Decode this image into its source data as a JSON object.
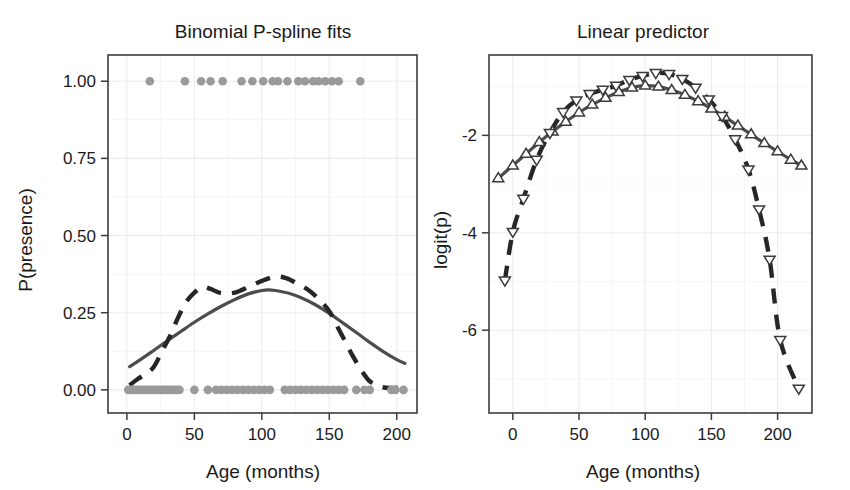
{
  "figure": {
    "width": 850,
    "height": 490,
    "background": "#ffffff",
    "panel_count": 2,
    "colors": {
      "solid_fit": "#4d4d4d",
      "dashed_fit": "#262626",
      "observed_points": "#9a9a9a",
      "marker_stroke": "#3a3a3a",
      "marker_fill": "#ffffff",
      "axis": "#3c3c3c",
      "gridline_major": "#ececec",
      "gridline_minor": "#f5f5f5",
      "text": "#1a1a1a"
    }
  },
  "chart_data": [
    {
      "type": "line",
      "panel": "left",
      "title": "Binomial P-spline fits",
      "xlabel": "Age (months)",
      "ylabel": "P(presence)",
      "xlim": [
        -14,
        215
      ],
      "ylim": [
        -0.075,
        1.085
      ],
      "xticks": [
        0,
        50,
        100,
        150,
        200
      ],
      "xtick_labels": [
        "0",
        "50",
        "100",
        "150",
        "200"
      ],
      "yticks": [
        0.0,
        0.25,
        0.5,
        0.75,
        1.0
      ],
      "ytick_labels": [
        "0.00",
        "0.25",
        "0.50",
        "0.75",
        "1.00"
      ],
      "grid": true,
      "legend": "none",
      "series": [
        {
          "name": "P-spline fit (solid)",
          "style": "solid",
          "color": "#4d4d4d",
          "x": [
            2,
            10,
            20,
            30,
            40,
            50,
            60,
            70,
            80,
            90,
            100,
            105,
            110,
            120,
            130,
            140,
            150,
            160,
            170,
            180,
            190,
            200,
            206
          ],
          "y": [
            0.075,
            0.098,
            0.128,
            0.159,
            0.189,
            0.219,
            0.246,
            0.271,
            0.293,
            0.311,
            0.322,
            0.324,
            0.322,
            0.313,
            0.297,
            0.275,
            0.248,
            0.217,
            0.186,
            0.154,
            0.124,
            0.098,
            0.086
          ]
        },
        {
          "name": "Alternative fit (dashed)",
          "style": "dashed",
          "color": "#262626",
          "x": [
            2,
            8,
            14,
            20,
            26,
            32,
            38,
            44,
            50,
            56,
            62,
            70,
            80,
            90,
            100,
            110,
            118,
            126,
            134,
            142,
            150,
            156,
            162,
            168,
            174,
            180,
            188,
            196,
            202,
            206
          ],
          "y": [
            0.015,
            0.035,
            0.052,
            0.075,
            0.125,
            0.175,
            0.235,
            0.285,
            0.315,
            0.333,
            0.327,
            0.313,
            0.315,
            0.333,
            0.353,
            0.367,
            0.362,
            0.345,
            0.325,
            0.295,
            0.255,
            0.205,
            0.155,
            0.105,
            0.062,
            0.028,
            0.01,
            0.006,
            0.008,
            0.01
          ]
        }
      ],
      "observed_presence": {
        "name": "Observed presence (y = 1)",
        "y": 1.0,
        "x": [
          17,
          43,
          55,
          62,
          71,
          85,
          93,
          101,
          108,
          112,
          119,
          127,
          132,
          138,
          142,
          147,
          152,
          157,
          173
        ]
      },
      "observed_absence": {
        "name": "Observed absence (y = 0)",
        "y": 0.0,
        "x": [
          1,
          3,
          5,
          7,
          9,
          11,
          13,
          15,
          17,
          19,
          21,
          23,
          25,
          27,
          29,
          31,
          33,
          35,
          37,
          39,
          50,
          60,
          66,
          70,
          74,
          78,
          82,
          86,
          90,
          94,
          98,
          102,
          106,
          117,
          121,
          125,
          129,
          133,
          137,
          141,
          145,
          149,
          153,
          157,
          161,
          170,
          176,
          180,
          196,
          199,
          205
        ]
      }
    },
    {
      "type": "line",
      "panel": "right",
      "title": "Linear predictor",
      "xlabel": "Age (months)",
      "ylabel": "logit(p)",
      "xlim": [
        -18,
        226
      ],
      "ylim": [
        -7.7,
        -0.35
      ],
      "xticks": [
        0,
        50,
        100,
        150,
        200
      ],
      "xtick_labels": [
        "0",
        "50",
        "100",
        "150",
        "200"
      ],
      "yticks": [
        -2,
        -4,
        -6
      ],
      "ytick_labels": [
        "-2",
        "-4",
        "-6"
      ],
      "grid": true,
      "legend": "none",
      "series": [
        {
          "name": "P-spline linear predictor (solid, up-triangle markers)",
          "style": "solid",
          "marker": "triangle-up",
          "color": "#4d4d4d",
          "x": [
            -11,
            0,
            10,
            20,
            30,
            40,
            50,
            60,
            70,
            80,
            90,
            100,
            110,
            120,
            130,
            140,
            150,
            160,
            170,
            180,
            190,
            200,
            210,
            218
          ],
          "y": [
            -2.88,
            -2.62,
            -2.38,
            -2.14,
            -1.92,
            -1.72,
            -1.53,
            -1.37,
            -1.23,
            -1.11,
            -1.02,
            -0.98,
            -1.0,
            -1.07,
            -1.17,
            -1.3,
            -1.45,
            -1.62,
            -1.8,
            -1.98,
            -2.16,
            -2.33,
            -2.5,
            -2.62
          ]
        },
        {
          "name": "Alternative linear predictor (dashed, down-triangle markers)",
          "style": "dashed",
          "marker": "triangle-down",
          "color": "#262626",
          "x": [
            -6,
            0,
            8,
            18,
            28,
            38,
            48,
            58,
            68,
            78,
            88,
            98,
            108,
            118,
            128,
            138,
            148,
            158,
            168,
            178,
            186,
            194,
            202,
            216
          ],
          "y": [
            -4.98,
            -3.98,
            -3.3,
            -2.5,
            -1.95,
            -1.52,
            -1.28,
            -1.15,
            -1.06,
            -0.98,
            -0.86,
            -0.78,
            -0.72,
            -0.74,
            -0.84,
            -1.02,
            -1.26,
            -1.6,
            -2.08,
            -2.7,
            -3.52,
            -4.55,
            -6.2,
            -7.2
          ]
        }
      ]
    }
  ]
}
